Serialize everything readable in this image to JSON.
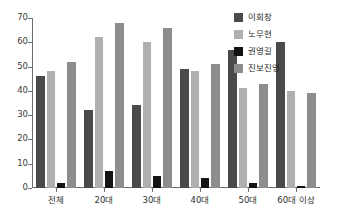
{
  "chart_data": {
    "type": "bar",
    "title": "",
    "subtitle": "",
    "xlabel": "",
    "ylabel": "",
    "ylim": [
      0,
      70
    ],
    "ytick_values": [
      0,
      10,
      20,
      30,
      40,
      50,
      60,
      70
    ],
    "ytick_labels": [
      "0",
      "10",
      "20",
      "30",
      "40",
      "50",
      "60",
      "70"
    ],
    "grid": false,
    "legend_position": "right-top",
    "categories": [
      "전체",
      "20대",
      "30대",
      "40대",
      "50대",
      "60대 이상"
    ],
    "series": [
      {
        "name": "이회창",
        "color": "#4a4a4a",
        "values": [
          46,
          32,
          34,
          49,
          57,
          60
        ]
      },
      {
        "name": "노무현",
        "color": "#b0b0b0",
        "values": [
          48,
          62,
          60,
          48,
          41,
          40
        ]
      },
      {
        "name": "권영길",
        "color": "#131313",
        "values": [
          2,
          7,
          5,
          4,
          2,
          1
        ]
      },
      {
        "name": "진보진영",
        "color": "#8d8d8d",
        "values": [
          52,
          68,
          66,
          51,
          43,
          39
        ]
      }
    ]
  },
  "axis": {
    "y_axis_color": "#6f6f6f",
    "x_axis_color": "#6f6f6f"
  }
}
